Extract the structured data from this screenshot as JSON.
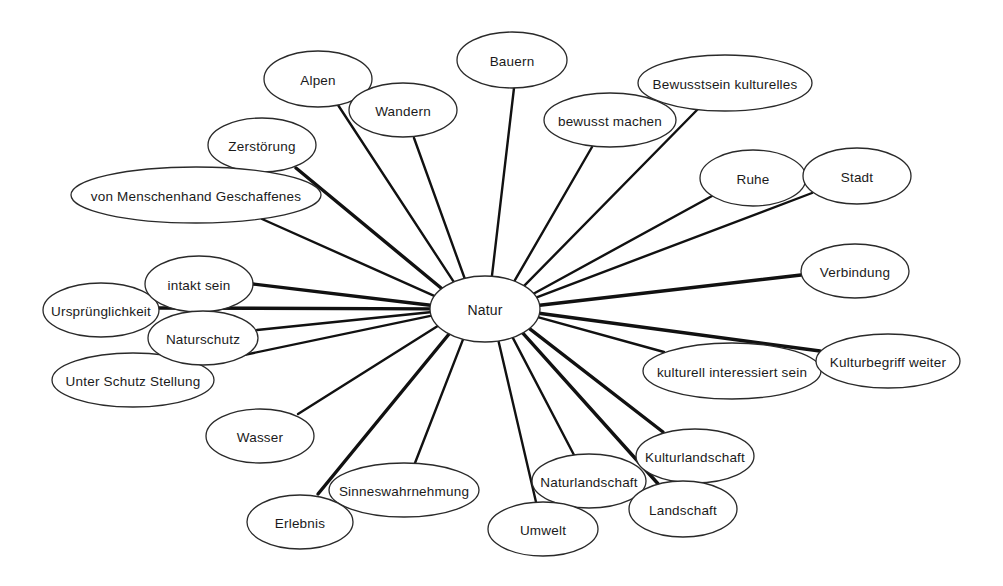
{
  "diagram": {
    "type": "mind-map",
    "center": {
      "id": "natur",
      "label": "Natur"
    },
    "nodes": [
      {
        "id": "alpen",
        "label": "Alpen"
      },
      {
        "id": "wandern",
        "label": "Wandern"
      },
      {
        "id": "bauern",
        "label": "Bauern"
      },
      {
        "id": "bewusstsein-kulturelles",
        "label": "Bewusstsein kulturelles"
      },
      {
        "id": "bewusst-machen",
        "label": "bewusst machen"
      },
      {
        "id": "zerstoerung",
        "label": "Zerstörung"
      },
      {
        "id": "von-menschenhand",
        "label": "von Menschenhand Geschaffenes"
      },
      {
        "id": "ruhe",
        "label": "Ruhe"
      },
      {
        "id": "stadt",
        "label": "Stadt"
      },
      {
        "id": "verbindung",
        "label": "Verbindung"
      },
      {
        "id": "intakt-sein",
        "label": "intakt sein"
      },
      {
        "id": "urspruenglichkeit",
        "label": "Ursprünglichkeit"
      },
      {
        "id": "naturschutz",
        "label": "Naturschutz"
      },
      {
        "id": "unter-schutz-stellung",
        "label": "Unter Schutz Stellung"
      },
      {
        "id": "wasser",
        "label": "Wasser"
      },
      {
        "id": "kulturell-interessiert",
        "label": "kulturell interessiert sein"
      },
      {
        "id": "kulturbegriff-weiter",
        "label": "Kulturbegriff weiter"
      },
      {
        "id": "sinneswahrnehmung",
        "label": "Sinneswahrnehmung"
      },
      {
        "id": "erlebnis",
        "label": "Erlebnis"
      },
      {
        "id": "kulturlandschaft",
        "label": "Kulturlandschaft"
      },
      {
        "id": "naturlandschaft",
        "label": "Naturlandschaft"
      },
      {
        "id": "landschaft",
        "label": "Landschaft"
      },
      {
        "id": "umwelt",
        "label": "Umwelt"
      }
    ],
    "edges": [
      {
        "from": "natur",
        "to": "alpen"
      },
      {
        "from": "natur",
        "to": "wandern"
      },
      {
        "from": "natur",
        "to": "bauern"
      },
      {
        "from": "natur",
        "to": "bewusstsein-kulturelles"
      },
      {
        "from": "natur",
        "to": "bewusst-machen"
      },
      {
        "from": "natur",
        "to": "zerstoerung",
        "emphasis": "strong"
      },
      {
        "from": "natur",
        "to": "von-menschenhand"
      },
      {
        "from": "natur",
        "to": "ruhe"
      },
      {
        "from": "natur",
        "to": "stadt"
      },
      {
        "from": "natur",
        "to": "verbindung",
        "emphasis": "strong"
      },
      {
        "from": "natur",
        "to": "intakt-sein",
        "emphasis": "strong"
      },
      {
        "from": "natur",
        "to": "urspruenglichkeit",
        "emphasis": "strong"
      },
      {
        "from": "natur",
        "to": "naturschutz"
      },
      {
        "from": "natur",
        "to": "unter-schutz-stellung"
      },
      {
        "from": "natur",
        "to": "wasser"
      },
      {
        "from": "natur",
        "to": "kulturell-interessiert"
      },
      {
        "from": "natur",
        "to": "kulturbegriff-weiter",
        "emphasis": "strong"
      },
      {
        "from": "natur",
        "to": "sinneswahrnehmung"
      },
      {
        "from": "natur",
        "to": "erlebnis",
        "emphasis": "strong"
      },
      {
        "from": "natur",
        "to": "kulturlandschaft",
        "emphasis": "strong"
      },
      {
        "from": "natur",
        "to": "naturlandschaft"
      },
      {
        "from": "natur",
        "to": "landschaft",
        "emphasis": "strong"
      },
      {
        "from": "natur",
        "to": "umwelt"
      }
    ]
  }
}
